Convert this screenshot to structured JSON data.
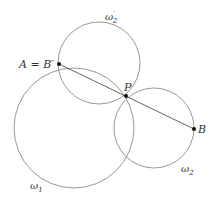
{
  "diagram": {
    "title": "",
    "circles": [
      {
        "id": "omega1",
        "label": "ω",
        "sub": "1",
        "sup": "",
        "cx": 74,
        "cy": 128,
        "r": 60,
        "label_x": 30,
        "label_y": 189
      },
      {
        "id": "omega2prime",
        "label": "ω",
        "sub": "2",
        "sup": "′",
        "cx": 99,
        "cy": 63,
        "r": 41,
        "label_x": 105,
        "label_y": 20
      },
      {
        "id": "omega2",
        "label": "ω",
        "sub": "2",
        "sup": "",
        "cx": 154,
        "cy": 128,
        "r": 40,
        "label_x": 181,
        "label_y": 172
      }
    ],
    "points": [
      {
        "id": "A",
        "label": "A = B′",
        "x": 59,
        "y": 64,
        "label_x": 19,
        "label_y": 68
      },
      {
        "id": "P",
        "label": "P",
        "x": 126,
        "y": 96,
        "label_x": 124,
        "label_y": 91
      },
      {
        "id": "B",
        "label": "B",
        "x": 194,
        "y": 129,
        "label_x": 198,
        "label_y": 133
      }
    ],
    "segments": [
      {
        "from": "A",
        "to": "B"
      }
    ],
    "colors": {
      "circle_stroke": "#8c8c8c",
      "segment_stroke": "#555555",
      "point_fill": "#111111",
      "label_color": "#333333"
    }
  }
}
